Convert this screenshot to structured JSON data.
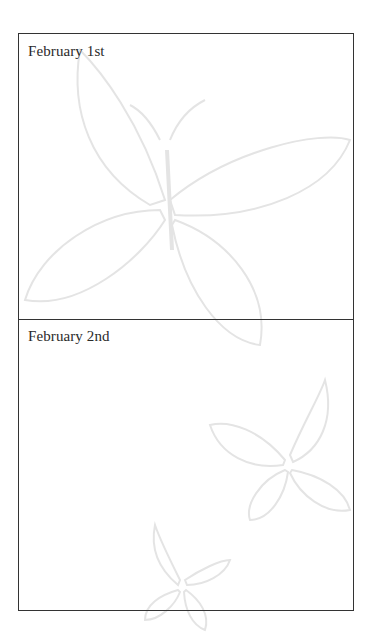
{
  "page": {
    "sections": [
      {
        "label": "February 1st"
      },
      {
        "label": "February 2nd"
      }
    ],
    "colors": {
      "border": "#333333",
      "text": "#2a2a2a",
      "watermark": "#e6e6e6"
    }
  }
}
